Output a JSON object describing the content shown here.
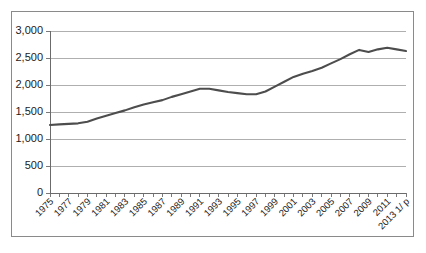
{
  "chart_data": {
    "type": "line",
    "title": "",
    "subtitle": "",
    "xlabel": "",
    "ylabel": "",
    "grid": true,
    "legend": false,
    "legend_position": "none",
    "xlim": [
      1975,
      2013
    ],
    "ylim": [
      0,
      3000
    ],
    "y_ticks": [
      0,
      500,
      1000,
      1500,
      2000,
      2500,
      3000
    ],
    "y_tick_labels": [
      "0",
      "500",
      "1,000",
      "1,500",
      "2,000",
      "2,500",
      "3,000"
    ],
    "x_tick_labels": [
      "1975",
      "1977",
      "1979",
      "1981",
      "1983",
      "1985",
      "1987",
      "1989",
      "1991",
      "1993",
      "1995",
      "1997",
      "1999",
      "2001",
      "2003",
      "2005",
      "2007",
      "2009",
      "2011",
      "2013 1/ p"
    ],
    "x_minor_tick_count": 39,
    "line_color": "#4d4d4d",
    "x": [
      1975,
      1976,
      1977,
      1978,
      1979,
      1980,
      1981,
      1982,
      1983,
      1984,
      1985,
      1986,
      1987,
      1988,
      1989,
      1990,
      1991,
      1992,
      1993,
      1994,
      1995,
      1996,
      1997,
      1998,
      1999,
      2000,
      2001,
      2002,
      2003,
      2004,
      2005,
      2006,
      2007,
      2008,
      2009,
      2010,
      2011,
      2012,
      2013
    ],
    "values": [
      1260,
      1270,
      1280,
      1290,
      1320,
      1380,
      1430,
      1480,
      1530,
      1590,
      1640,
      1680,
      1720,
      1780,
      1830,
      1880,
      1930,
      1930,
      1900,
      1870,
      1850,
      1830,
      1830,
      1880,
      1970,
      2060,
      2150,
      2210,
      2260,
      2320,
      2400,
      2480,
      2570,
      2650,
      2610,
      2660,
      2690,
      2660,
      2630
    ]
  }
}
